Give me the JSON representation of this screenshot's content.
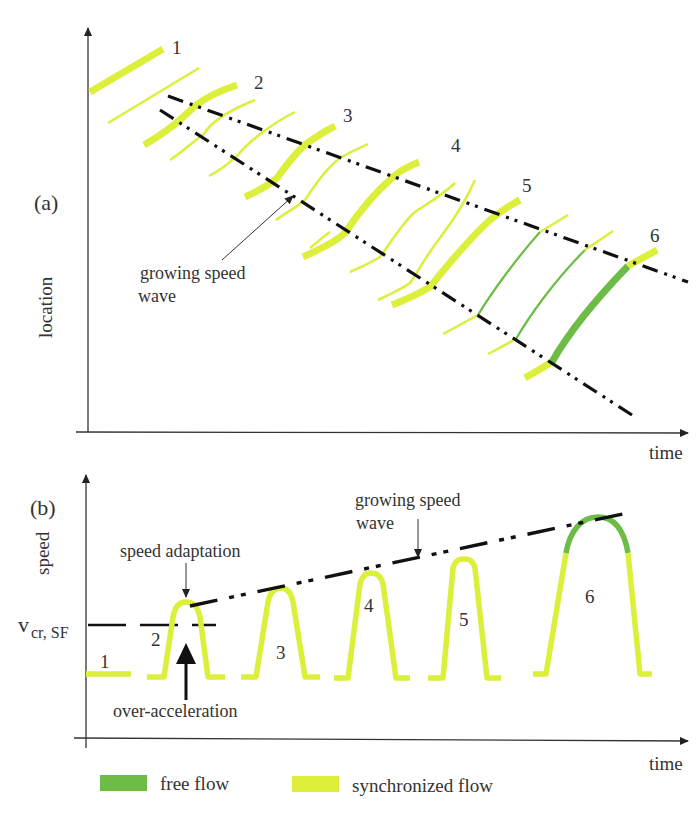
{
  "colors": {
    "synchronized": "#dcef3a",
    "free": "#6cbc45",
    "axis": "#333333",
    "wave": "#111111"
  },
  "panel_a": {
    "label": "(a)",
    "y_axis_label": "location",
    "x_axis_label": "time",
    "annotation": [
      "growing speed",
      "wave"
    ],
    "trajectory_labels": [
      "1",
      "2",
      "3",
      "4",
      "5",
      "6"
    ]
  },
  "panel_b": {
    "label": "(b)",
    "y_axis_label": "speed",
    "x_axis_label": "time",
    "vcr_label_main": "v",
    "vcr_label_sub": "cr, SF",
    "speed_adaptation_label": "speed adaptation",
    "over_acceleration_label": "over-acceleration",
    "wave_annotation": [
      "growing speed",
      "wave"
    ],
    "peak_labels": [
      "1",
      "2",
      "3",
      "4",
      "5",
      "6"
    ]
  },
  "legend": {
    "items": [
      {
        "label": "free flow",
        "color_key": "free"
      },
      {
        "label": "synchronized flow",
        "color_key": "synchronized"
      }
    ]
  }
}
